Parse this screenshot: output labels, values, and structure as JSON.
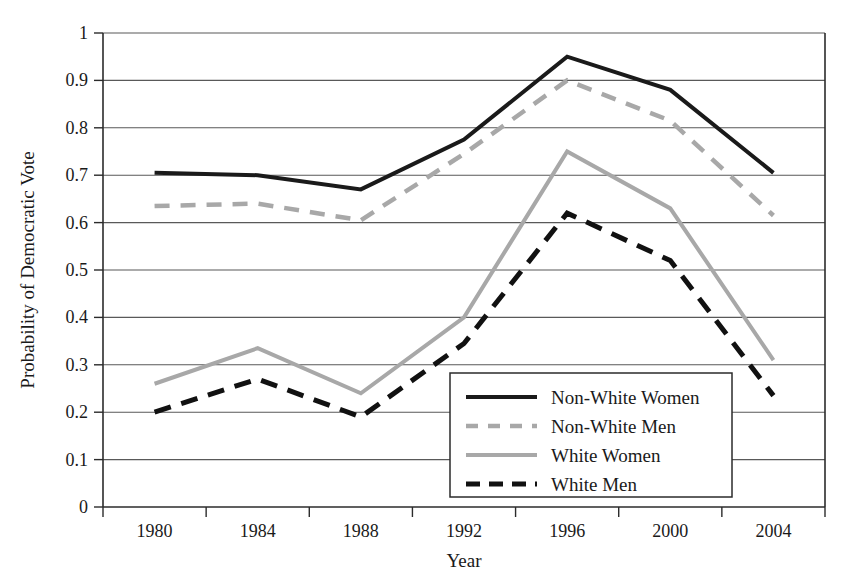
{
  "chart_data": {
    "type": "line",
    "title": "",
    "xlabel": "Year",
    "ylabel": "Probability of Democratic Vote",
    "categories": [
      "1980",
      "1984",
      "1988",
      "1992",
      "1996",
      "2000",
      "2004"
    ],
    "x": [
      1980,
      1984,
      1988,
      1992,
      1996,
      2000,
      2004
    ],
    "xlim": [
      1978,
      2006
    ],
    "ylim": [
      0,
      1
    ],
    "ytick_labels": [
      "0",
      "0.1",
      "0.2",
      "0.3",
      "0.4",
      "0.5",
      "0.6",
      "0.7",
      "0.8",
      "0.9",
      "1"
    ],
    "ytick_values": [
      0,
      0.1,
      0.2,
      0.3,
      0.4,
      0.5,
      0.6,
      0.7,
      0.8,
      0.9,
      1
    ],
    "grid": "horizontal",
    "legend_position": "lower-right-inside",
    "series": [
      {
        "name": "Non-White Women",
        "values": [
          0.705,
          0.7,
          0.67,
          0.775,
          0.95,
          0.88,
          0.705
        ],
        "color": "#1a1a1a",
        "style": "solid",
        "width": 4
      },
      {
        "name": "Non-White Men",
        "values": [
          0.635,
          0.64,
          0.605,
          0.745,
          0.9,
          0.815,
          0.615
        ],
        "color": "#a8a8a8",
        "style": "dashed",
        "width": 4.5
      },
      {
        "name": "White Women",
        "values": [
          0.26,
          0.335,
          0.24,
          0.4,
          0.75,
          0.63,
          0.31
        ],
        "color": "#a8a8a8",
        "style": "solid",
        "width": 4
      },
      {
        "name": "White Men",
        "values": [
          0.2,
          0.27,
          0.19,
          0.345,
          0.62,
          0.52,
          0.235
        ],
        "color": "#111111",
        "style": "dashed",
        "width": 5
      }
    ]
  },
  "legend": {
    "entries": [
      {
        "label": "Non-White Women"
      },
      {
        "label": "Non-White Men"
      },
      {
        "label": "White Women"
      },
      {
        "label": "White Men"
      }
    ]
  },
  "colors": {
    "black": "#1a1a1a",
    "gray": "#a8a8a8",
    "grid": "#595959",
    "background": "#ffffff"
  }
}
